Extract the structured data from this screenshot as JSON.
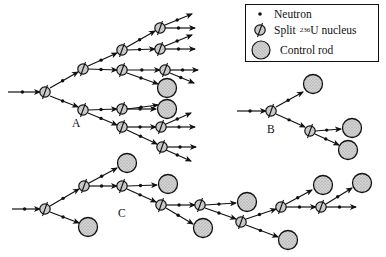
{
  "legend": {
    "neutron": "Neutron",
    "split_prefix": "Split",
    "split_isotope": "236",
    "split_suffix": "U nucleus",
    "control_rod": "Control rod"
  },
  "labels": {
    "a": "A",
    "b": "B",
    "c": "C"
  },
  "colors": {
    "line": "#111111",
    "fill": "#c8c8c8",
    "background": "#ffffff"
  },
  "trees": {
    "A": {
      "nuclei": [
        [
          45,
          92
        ],
        [
          83,
          69
        ],
        [
          83,
          110
        ],
        [
          122,
          50
        ],
        [
          122,
          70
        ],
        [
          122,
          109
        ],
        [
          122,
          127
        ],
        [
          160,
          28
        ],
        [
          160,
          49
        ],
        [
          165,
          70
        ],
        [
          161,
          127
        ],
        [
          162,
          147
        ]
      ],
      "rods": [
        [
          167,
          88
        ],
        [
          167,
          109
        ]
      ],
      "edges": [
        [
          [
            8,
            92
          ],
          [
            40,
            92
          ]
        ],
        [
          [
            50,
            88
          ],
          [
            78,
            72
          ]
        ],
        [
          [
            50,
            96
          ],
          [
            78,
            107
          ]
        ],
        [
          [
            88,
            66
          ],
          [
            117,
            53
          ]
        ],
        [
          [
            88,
            69
          ],
          [
            117,
            70
          ]
        ],
        [
          [
            88,
            110
          ],
          [
            117,
            109
          ]
        ],
        [
          [
            88,
            113
          ],
          [
            117,
            125
          ]
        ],
        [
          [
            127,
            47
          ],
          [
            155,
            31
          ]
        ],
        [
          [
            127,
            50
          ],
          [
            155,
            49
          ]
        ],
        [
          [
            127,
            70
          ],
          [
            160,
            70
          ]
        ],
        [
          [
            127,
            73
          ],
          [
            158,
            84
          ]
        ],
        [
          [
            127,
            109
          ],
          [
            158,
            105
          ]
        ],
        [
          [
            127,
            109
          ],
          [
            156,
            109
          ]
        ],
        [
          [
            127,
            127
          ],
          [
            156,
            127
          ]
        ],
        [
          [
            127,
            130
          ],
          [
            157,
            144
          ]
        ],
        [
          [
            165,
            25
          ],
          [
            192,
            14
          ]
        ],
        [
          [
            165,
            28
          ],
          [
            195,
            28
          ]
        ],
        [
          [
            165,
            46
          ],
          [
            192,
            35
          ]
        ],
        [
          [
            165,
            49
          ],
          [
            195,
            49
          ]
        ],
        [
          [
            170,
            70
          ],
          [
            198,
            70
          ]
        ],
        [
          [
            170,
            73
          ],
          [
            194,
            83
          ]
        ],
        [
          [
            166,
            124
          ],
          [
            191,
            113
          ]
        ],
        [
          [
            166,
            127
          ],
          [
            195,
            127
          ]
        ],
        [
          [
            167,
            147
          ],
          [
            196,
            147
          ]
        ],
        [
          [
            166,
            150
          ],
          [
            191,
            161
          ]
        ]
      ]
    },
    "B": {
      "nuclei": [
        [
          271,
          111
        ],
        [
          310,
          131
        ]
      ],
      "rods": [
        [
          313,
          84
        ],
        [
          352,
          128
        ],
        [
          348,
          150
        ]
      ],
      "edges": [
        [
          [
            237,
            111
          ],
          [
            266,
            111
          ]
        ],
        [
          [
            276,
            107
          ],
          [
            303,
            92
          ]
        ],
        [
          [
            276,
            114
          ],
          [
            305,
            127
          ]
        ],
        [
          [
            315,
            131
          ],
          [
            341,
            129
          ]
        ],
        [
          [
            315,
            134
          ],
          [
            339,
            145
          ]
        ]
      ]
    },
    "C": {
      "nuclei": [
        [
          45,
          209
        ],
        [
          84,
          186
        ],
        [
          122,
          186
        ],
        [
          161,
          205
        ],
        [
          200,
          205
        ],
        [
          241,
          222
        ],
        [
          281,
          207
        ],
        [
          321,
          207
        ]
      ],
      "rods": [
        [
          88,
          227
        ],
        [
          127,
          163
        ],
        [
          168,
          184
        ],
        [
          203,
          228
        ],
        [
          247,
          202
        ],
        [
          288,
          240
        ],
        [
          323,
          185
        ],
        [
          362,
          183
        ]
      ],
      "edges": [
        [
          [
            12,
            209
          ],
          [
            40,
            209
          ]
        ],
        [
          [
            50,
            206
          ],
          [
            79,
            189
          ]
        ],
        [
          [
            50,
            212
          ],
          [
            79,
            223
          ]
        ],
        [
          [
            89,
            183
          ],
          [
            117,
            168
          ]
        ],
        [
          [
            89,
            186
          ],
          [
            117,
            186
          ]
        ],
        [
          [
            127,
            186
          ],
          [
            157,
            185
          ]
        ],
        [
          [
            127,
            189
          ],
          [
            156,
            202
          ]
        ],
        [
          [
            166,
            205
          ],
          [
            195,
            205
          ]
        ],
        [
          [
            166,
            208
          ],
          [
            193,
            224
          ]
        ],
        [
          [
            205,
            205
          ],
          [
            236,
            203
          ]
        ],
        [
          [
            205,
            208
          ],
          [
            236,
            219
          ]
        ],
        [
          [
            246,
            219
          ],
          [
            276,
            209
          ]
        ],
        [
          [
            246,
            225
          ],
          [
            278,
            237
          ]
        ],
        [
          [
            286,
            204
          ],
          [
            312,
            190
          ]
        ],
        [
          [
            286,
            207
          ],
          [
            316,
            207
          ]
        ],
        [
          [
            326,
            204
          ],
          [
            352,
            188
          ]
        ],
        [
          [
            326,
            207
          ],
          [
            356,
            207
          ]
        ]
      ]
    }
  }
}
